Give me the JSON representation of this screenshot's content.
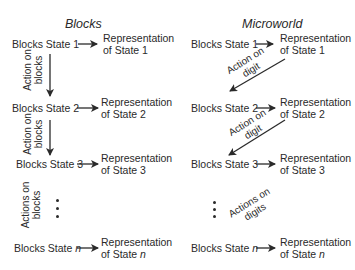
{
  "diagram": {
    "left": {
      "title": "Blocks",
      "states": [
        {
          "label": "Blocks State 1",
          "rep1": "Representation",
          "rep2": "of State 1"
        },
        {
          "label": "Blocks State 2",
          "rep1": "Representation",
          "rep2": "of State 2"
        },
        {
          "label": "Blocks State 3",
          "rep1": "Representation",
          "rep2": "of State 3"
        },
        {
          "label": "Blocks State ",
          "label_var": "n",
          "rep1": "Representation",
          "rep2": "of State ",
          "rep_var": "n"
        }
      ],
      "actions": [
        {
          "line1": "Action on",
          "line2": "blocks"
        },
        {
          "line1": "Action on",
          "line2": "blocks"
        },
        {
          "line1": "Actions on",
          "line2": "blocks"
        }
      ],
      "ellipsis": "•\n•\n•"
    },
    "right": {
      "title": "Microworld",
      "states": [
        {
          "label": "Blocks State 1",
          "rep1": "Representation",
          "rep2": "of State 1"
        },
        {
          "label": "Blocks State 2",
          "rep1": "Representation",
          "rep2": "of State 2"
        },
        {
          "label": "Blocks State 3",
          "rep1": "Representation",
          "rep2": "of State 3"
        },
        {
          "label": "Blocks State ",
          "label_var": "n",
          "rep1": "Representation",
          "rep2": "of State ",
          "rep_var": "n"
        }
      ],
      "actions": [
        {
          "line1": "Action on",
          "line2": "digit"
        },
        {
          "line1": "Action on",
          "line2": "digit"
        },
        {
          "line1": "Actions on",
          "line2": "digits"
        }
      ]
    }
  }
}
